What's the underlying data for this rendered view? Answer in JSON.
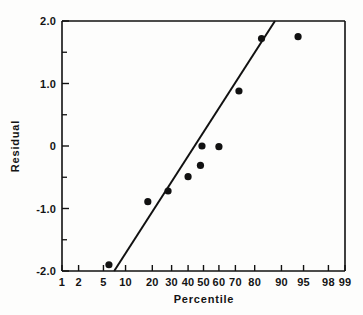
{
  "chart_data": {
    "type": "scatter",
    "title": "",
    "subtitle": "",
    "xlabel": "Percentile",
    "ylabel": "Residual",
    "x_scale": "probability",
    "grid": false,
    "legend": null,
    "xlim": [
      1,
      99
    ],
    "ylim": [
      -2.0,
      2.0
    ],
    "x_ticks": [
      {
        "value": 1,
        "label": "1",
        "minor": false
      },
      {
        "value": 2,
        "label": "2",
        "minor": false
      },
      {
        "value": 5,
        "label": "5",
        "minor": false
      },
      {
        "value": 10,
        "label": "10",
        "minor": false
      },
      {
        "value": 20,
        "label": "20",
        "minor": false
      },
      {
        "value": 30,
        "label": "30",
        "minor": false
      },
      {
        "value": 40,
        "label": "40",
        "minor": false
      },
      {
        "value": 50,
        "label": "50",
        "minor": false
      },
      {
        "value": 60,
        "label": "60",
        "minor": false
      },
      {
        "value": 70,
        "label": "70",
        "minor": false
      },
      {
        "value": 80,
        "label": "80",
        "minor": false
      },
      {
        "value": 90,
        "label": "90",
        "minor": false
      },
      {
        "value": 95,
        "label": "95",
        "minor": false
      },
      {
        "value": 98,
        "label": "98",
        "minor": false
      },
      {
        "value": 99,
        "label": "99",
        "minor": false
      }
    ],
    "y_ticks": [
      {
        "value": 2.0,
        "label": "2.0",
        "minor": false
      },
      {
        "value": 1.5,
        "label": "",
        "minor": true
      },
      {
        "value": 1.0,
        "label": "1.0",
        "minor": false
      },
      {
        "value": 0.5,
        "label": "",
        "minor": true
      },
      {
        "value": 0.0,
        "label": "0",
        "minor": false
      },
      {
        "value": -0.5,
        "label": "",
        "minor": true
      },
      {
        "value": -1.0,
        "label": "-1.0",
        "minor": false
      },
      {
        "value": -1.5,
        "label": "",
        "minor": true
      },
      {
        "value": -2.0,
        "label": "-2.0",
        "minor": false
      }
    ],
    "series": [
      {
        "name": "Residuals",
        "marker": "filled-circle",
        "color": "#111111",
        "points": [
          {
            "x": 6,
            "y": -1.9
          },
          {
            "x": 18,
            "y": -0.89
          },
          {
            "x": 28,
            "y": -0.72
          },
          {
            "x": 40,
            "y": -0.49
          },
          {
            "x": 48,
            "y": -0.31
          },
          {
            "x": 49,
            "y": 0.0
          },
          {
            "x": 60,
            "y": -0.01
          },
          {
            "x": 72,
            "y": 0.88
          },
          {
            "x": 83,
            "y": 1.72
          },
          {
            "x": 94,
            "y": 1.75
          }
        ]
      }
    ],
    "fit_line": {
      "name": "Reference line",
      "color": "#111111",
      "x_start": 7.1,
      "y_start": -2.0,
      "x_end": 88.0,
      "y_end": 2.0
    }
  }
}
